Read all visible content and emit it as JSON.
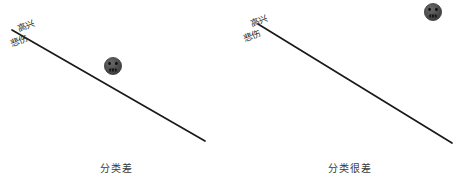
{
  "figure": {
    "background_color": "#ffffff",
    "panels": [
      {
        "id": "left",
        "caption": "分类差",
        "boundary_line": {
          "label_above": "高兴",
          "label_below": "悲伤",
          "x1": 12,
          "y1": 30,
          "x2": 205,
          "y2": 141,
          "color": "#1a1a1a",
          "width": 1.6
        },
        "data_point": {
          "icon": "sad-face-icon",
          "cx": 113,
          "cy": 66,
          "r": 8.5,
          "fill": "#4a4a4a",
          "side": "above-line"
        }
      },
      {
        "id": "right",
        "caption": "分类很差",
        "boundary_line": {
          "label_above": "高兴",
          "label_below": "悲伤",
          "x1": 25,
          "y1": 24,
          "x2": 219,
          "y2": 143,
          "color": "#1a1a1a",
          "width": 1.6
        },
        "data_point": {
          "icon": "sad-face-icon",
          "cx": 200,
          "cy": 12,
          "r": 8.5,
          "fill": "#4a4a4a",
          "side": "above-line"
        }
      }
    ]
  },
  "colors": {
    "line": "#1a1a1a",
    "face_fill": "#4a4a4a",
    "face_feature": "#121212",
    "text": "#2b2b2b",
    "caption_text": "#3a3a3a"
  }
}
